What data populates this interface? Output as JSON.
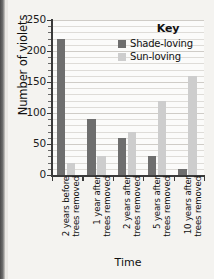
{
  "chart_data": {
    "type": "bar",
    "title": "",
    "xlabel": "Time",
    "ylabel": "Number of violets",
    "ylim": [
      0,
      250
    ],
    "ytick_values": [
      0,
      50,
      100,
      150,
      200,
      250
    ],
    "ytick_labels": [
      "0",
      "50",
      "100",
      "150",
      "200",
      "250"
    ],
    "grid": "horizontal",
    "legend_title": "Key",
    "legend_position": "top-right-inside",
    "categories": [
      "2 years before trees removed",
      "1 year after trees removed",
      "2 years after trees removed",
      "5 years after trees removed",
      "10 years after trees removed"
    ],
    "category_lines": [
      [
        "2 years before",
        "trees removed"
      ],
      [
        "1 year after",
        "trees removed"
      ],
      [
        "2 years after",
        "trees removed"
      ],
      [
        "5 years after",
        "trees removed"
      ],
      [
        "10 years after",
        "trees removed"
      ]
    ],
    "series": [
      {
        "name": "Shade-loving",
        "color": "#6e6e6e",
        "values": [
          220,
          90,
          60,
          30,
          10
        ]
      },
      {
        "name": "Sun-loving",
        "color": "#cdcdcd",
        "values": [
          20,
          30,
          70,
          120,
          160
        ]
      }
    ]
  },
  "colors": {
    "shade_loving": "#6e6e6e",
    "sun_loving": "#cdcdcd",
    "axis": "#3a3a3a",
    "gridline": "#dedcd8",
    "plot_background": "#fbfbfa",
    "page_background": "#f4f3f0"
  }
}
